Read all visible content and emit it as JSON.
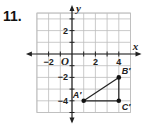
{
  "problem_number": "11.",
  "chart_data": {
    "type": "scatter",
    "title": "",
    "xlabel": "x",
    "ylabel": "y",
    "origin_label": "O",
    "xlim": [
      -3,
      5
    ],
    "ylim": [
      -5,
      3.5
    ],
    "grid": true,
    "x_ticks": [
      -2,
      2,
      4
    ],
    "y_ticks": [
      2,
      -2,
      -4
    ],
    "x_tick_labels": [
      "−2",
      "2",
      "4"
    ],
    "y_tick_labels": [
      "2",
      "−2",
      "−4"
    ],
    "points": [
      {
        "label": "A′",
        "x": 1,
        "y": -4
      },
      {
        "label": "B′",
        "x": 4,
        "y": -2
      },
      {
        "label": "C′",
        "x": 4,
        "y": -4
      }
    ],
    "segments": [
      {
        "from": "A′",
        "to": "B′"
      },
      {
        "from": "B′",
        "to": "C′"
      },
      {
        "from": "C′",
        "to": "A′"
      }
    ],
    "shape": "triangle A′B′C′"
  }
}
